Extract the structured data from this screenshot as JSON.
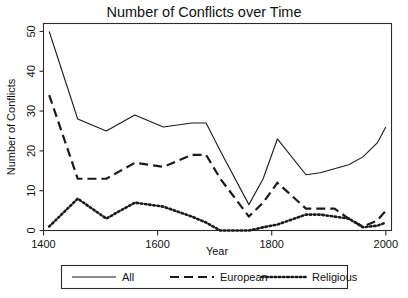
{
  "chart_data": {
    "type": "line",
    "title": "Number of Conflicts over Time",
    "xlabel": "Year",
    "ylabel": "Number of Conflicts",
    "xlim": [
      1400,
      2010
    ],
    "ylim": [
      0,
      52
    ],
    "xticks": [
      1400,
      1600,
      1800,
      2000
    ],
    "xtick_labels": [
      "1400",
      "1600",
      "1800",
      "2000"
    ],
    "yticks": [
      0,
      10,
      20,
      30,
      40,
      50
    ],
    "ytick_labels": [
      "0",
      "10",
      "20",
      "30",
      "40",
      "50"
    ],
    "grid": false,
    "legend_position": "below",
    "x": [
      1410,
      1460,
      1510,
      1560,
      1610,
      1660,
      1685,
      1710,
      1760,
      1785,
      1810,
      1860,
      1885,
      1910,
      1935,
      1960,
      1985,
      2000
    ],
    "series": [
      {
        "name": "All",
        "style": "solid",
        "color": "#1a1a1a",
        "values": [
          50,
          28,
          25,
          29,
          26,
          27,
          27,
          20,
          6.5,
          13,
          23,
          14,
          14.5,
          15.5,
          16.5,
          18.5,
          22,
          26
        ]
      },
      {
        "name": "European",
        "style": "dashed",
        "color": "#1a1a1a",
        "values": [
          34,
          13,
          13,
          17,
          16,
          19,
          19,
          13,
          3.5,
          7,
          12,
          5.5,
          5.5,
          5.5,
          3,
          1,
          2.5,
          5
        ]
      },
      {
        "name": "Religious",
        "style": "dotted",
        "color": "#1a1a1a",
        "values": [
          1,
          8,
          3,
          7,
          6,
          3.5,
          2,
          0,
          0,
          0.8,
          1.5,
          4,
          4,
          3.5,
          3,
          0.8,
          1.2,
          2
        ]
      }
    ]
  },
  "legend": {
    "entries": [
      {
        "label": "All",
        "style": "solid"
      },
      {
        "label": "European",
        "style": "dashed"
      },
      {
        "label": "Religious",
        "style": "dotted"
      }
    ]
  }
}
